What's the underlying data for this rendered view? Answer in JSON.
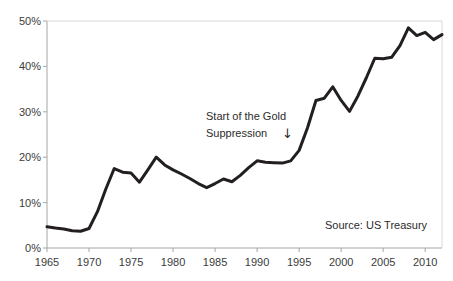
{
  "chart_data": {
    "type": "line",
    "title": "",
    "subtitle": "",
    "xlabel": "",
    "ylabel": "",
    "xlim": [
      1965,
      2012
    ],
    "ylim": [
      0,
      50
    ],
    "grid": false,
    "legend": null,
    "y_tick_labels": [
      "0%",
      "10%",
      "20%",
      "30%",
      "40%",
      "50%"
    ],
    "y_tick_values": [
      0,
      10,
      20,
      30,
      40,
      50
    ],
    "x_tick_labels": [
      "1965",
      "1970",
      "1975",
      "1980",
      "1985",
      "1990",
      "1995",
      "2000",
      "2005",
      "2010"
    ],
    "x_tick_values": [
      1965,
      1970,
      1975,
      1980,
      1985,
      1990,
      1995,
      2000,
      2005,
      2010
    ],
    "series": [
      {
        "name": "Value",
        "color": "#231f20",
        "line_width": 3,
        "x": [
          1965,
          1966,
          1967,
          1968,
          1969,
          1970,
          1971,
          1972,
          1973,
          1974,
          1975,
          1976,
          1977,
          1978,
          1979,
          1980,
          1981,
          1982,
          1983,
          1984,
          1985,
          1986,
          1987,
          1988,
          1989,
          1990,
          1991,
          1992,
          1993,
          1994,
          1995,
          1996,
          1997,
          1998,
          1999,
          2000,
          2001,
          2002,
          2003,
          2004,
          2005,
          2006,
          2007,
          2008,
          2009,
          2010,
          2011,
          2012
        ],
        "values": [
          4.7,
          4.4,
          4.2,
          3.8,
          3.7,
          4.3,
          8.0,
          13.0,
          17.5,
          16.7,
          16.5,
          14.5,
          17.2,
          20.0,
          18.3,
          17.2,
          16.3,
          15.3,
          14.2,
          13.3,
          14.2,
          15.2,
          14.6,
          16.0,
          17.7,
          19.2,
          18.9,
          18.8,
          18.7,
          19.2,
          21.5,
          26.5,
          32.5,
          33.0,
          35.5,
          32.5,
          30.1,
          33.5,
          37.5,
          41.8,
          41.7,
          42.0,
          44.6,
          48.5,
          46.8,
          47.5,
          45.9,
          47.0
        ]
      }
    ],
    "annotations": [
      {
        "name": "gold-suppression-note",
        "line1": "Start of the Gold",
        "line2": "Suppression",
        "arrow": "↓",
        "points_to_year": 1994
      },
      {
        "name": "source-note",
        "text": "Source: US Treasury"
      }
    ]
  },
  "axes": {
    "axis_line_color": "#a6a6a6",
    "tick_color": "#a6a6a6",
    "label_color": "#3b3b3b"
  }
}
